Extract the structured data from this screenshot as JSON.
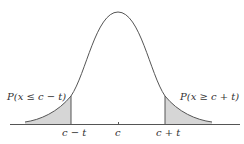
{
  "diagram": {
    "type": "normal-distribution-two-tailed",
    "colors": {
      "curve": "#555555",
      "shade": "#d6d6d6",
      "axis": "#555555",
      "text": "#333333"
    },
    "labels": {
      "left_tail": "P(x ≤ c − t)",
      "right_tail": "P(x ≥ c + t)",
      "tick_left": "c − t",
      "tick_center": "c",
      "tick_right": "c + t"
    }
  }
}
